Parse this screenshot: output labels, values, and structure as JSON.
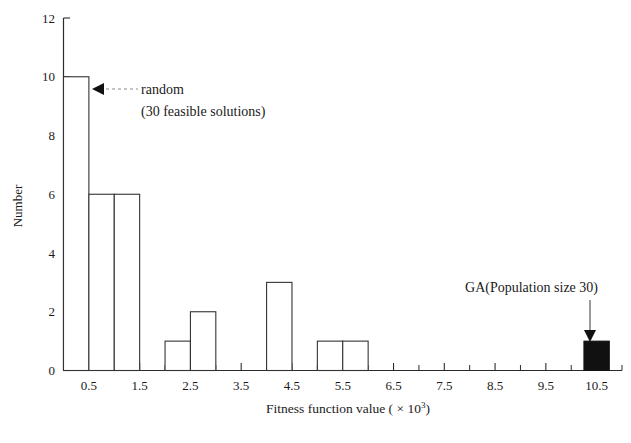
{
  "chart_data": {
    "type": "bar",
    "title": "",
    "xlabel": "Fitness function value ( × 10³)",
    "ylabel": "Number",
    "xlabel_main": "Fitness function value ( × 10",
    "xlabel_exp": "3",
    "xlabel_tail": ")",
    "ylim": [
      0,
      12
    ],
    "ytick_values": [
      0,
      2,
      4,
      6,
      8,
      10,
      12
    ],
    "ytick_labels": [
      "0",
      "2",
      "4",
      "6",
      "8",
      "10",
      "12"
    ],
    "xtick_labels": [
      "0.5",
      "1.5",
      "2.5",
      "3.5",
      "4.5",
      "5.5",
      "6.5",
      "7.5",
      "8.5",
      "9.5",
      "10.5"
    ],
    "xtick_values": [
      0.5,
      1.5,
      2.5,
      3.5,
      4.5,
      5.5,
      6.5,
      7.5,
      8.5,
      9.5,
      10.5
    ],
    "xlim": [
      0.0,
      11.0
    ],
    "bin_width": 0.5,
    "grid": false,
    "legend": "none",
    "series": [
      {
        "name": "random (30 feasible solutions)",
        "style": "open",
        "bins": [
          {
            "x0": 0.0,
            "x1": 0.5,
            "value": 10
          },
          {
            "x0": 0.5,
            "x1": 1.0,
            "value": 6
          },
          {
            "x0": 1.0,
            "x1": 1.5,
            "value": 6
          },
          {
            "x0": 1.5,
            "x1": 2.0,
            "value": 0
          },
          {
            "x0": 2.0,
            "x1": 2.5,
            "value": 1
          },
          {
            "x0": 2.5,
            "x1": 3.0,
            "value": 2
          },
          {
            "x0": 3.0,
            "x1": 3.5,
            "value": 0
          },
          {
            "x0": 3.5,
            "x1": 4.0,
            "value": 0
          },
          {
            "x0": 4.0,
            "x1": 4.5,
            "value": 3
          },
          {
            "x0": 4.5,
            "x1": 5.0,
            "value": 0
          },
          {
            "x0": 5.0,
            "x1": 5.5,
            "value": 1
          },
          {
            "x0": 5.5,
            "x1": 6.0,
            "value": 1
          },
          {
            "x0": 6.0,
            "x1": 6.5,
            "value": 0
          },
          {
            "x0": 6.5,
            "x1": 7.0,
            "value": 0
          },
          {
            "x0": 7.0,
            "x1": 7.5,
            "value": 0
          },
          {
            "x0": 7.5,
            "x1": 8.0,
            "value": 0
          },
          {
            "x0": 8.0,
            "x1": 8.5,
            "value": 0
          },
          {
            "x0": 8.5,
            "x1": 9.0,
            "value": 0
          },
          {
            "x0": 9.0,
            "x1": 9.5,
            "value": 0
          },
          {
            "x0": 9.5,
            "x1": 10.0,
            "value": 0
          }
        ]
      },
      {
        "name": "GA(Population size 30)",
        "style": "filled",
        "color": "#111111",
        "bins": [
          {
            "x0": 10.25,
            "x1": 10.75,
            "value": 1
          }
        ]
      }
    ],
    "annotations": [
      {
        "id": "random",
        "line1": "random",
        "line2": "(30 feasible solutions)",
        "arrow": "left",
        "points_to_bin": 0
      },
      {
        "id": "ga",
        "line1": "GA(Population size 30)",
        "arrow": "down",
        "points_to_bin": "10.5"
      }
    ],
    "colors": {
      "axis": "#2b2b2b",
      "bar_outline": "#333333",
      "bar_fill": "#ffffff",
      "ga_fill": "#111111",
      "text": "#1a1a1a",
      "leader": "#8a8a8a"
    }
  }
}
